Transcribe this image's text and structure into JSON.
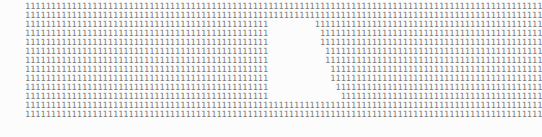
{
  "page": {
    "background_color": "#fcfcfc",
    "text_color": "#7d7d7d",
    "width_px": 449,
    "height_px": 137,
    "character": "1",
    "font_style": "monospace",
    "row_count": 13,
    "columns_per_row": 100,
    "char_width_px": 4,
    "row_pitch_px": 9,
    "left_margin_px": 25,
    "first_row_top_px": 10
  },
  "content": {
    "description": "Thirteen rows of repeated digit 1 characters forming a block of text with a rectangular whitespace gap in the middle-right area spanning rows 3 through 11.",
    "rows": [
      {
        "index": 1,
        "type": "full",
        "full": "1111111111111111111111111111111111111111111111111111111111111111111111111111111111111111111111111111"
      },
      {
        "index": 2,
        "type": "full",
        "full": "1111111111111111111111111111111111111111111111111111111111111111111111111111111111111111111111111111"
      },
      {
        "index": 3,
        "type": "split",
        "left": "11111111111111111111111111111111111111111111111",
        "gap": "         ",
        "right": "11111111111111111111111111111111111111111111"
      },
      {
        "index": 4,
        "type": "split",
        "left": "11111111111111111111111111111111111111111111111",
        "gap": "          ",
        "right": "1111111111111111111111111111111111111111111"
      },
      {
        "index": 5,
        "type": "split",
        "left": "11111111111111111111111111111111111111111111111",
        "gap": "          ",
        "right": "1111111111111111111111111111111111111111111"
      },
      {
        "index": 6,
        "type": "split",
        "left": "11111111111111111111111111111111111111111111111",
        "gap": "           ",
        "right": "111111111111111111111111111111111111111111"
      },
      {
        "index": 7,
        "type": "split",
        "left": "11111111111111111111111111111111111111111111111",
        "gap": "           ",
        "right": "111111111111111111111111111111111111111111"
      },
      {
        "index": 8,
        "type": "split",
        "left": "11111111111111111111111111111111111111111111111",
        "gap": "            ",
        "right": "11111111111111111111111111111111111111111"
      },
      {
        "index": 9,
        "type": "split",
        "left": "11111111111111111111111111111111111111111111111",
        "gap": "            ",
        "right": "11111111111111111111111111111111111111111"
      },
      {
        "index": 10,
        "type": "split",
        "left": "11111111111111111111111111111111111111111111111",
        "gap": "             ",
        "right": "1111111111111111111111111111111111111111"
      },
      {
        "index": 11,
        "type": "split",
        "left": "11111111111111111111111111111111111111111111111",
        "gap": "              ",
        "right": "111111111111111111111111111111111111111"
      },
      {
        "index": 12,
        "type": "full",
        "full": "1111111111111111111111111111111111111111111111111111111111111111111111111111111111111111111111111111"
      },
      {
        "index": 13,
        "type": "full",
        "full": "1111111111111111111111111111111111111111111111111111111111111111111111111111111111111111111111111111"
      }
    ]
  }
}
